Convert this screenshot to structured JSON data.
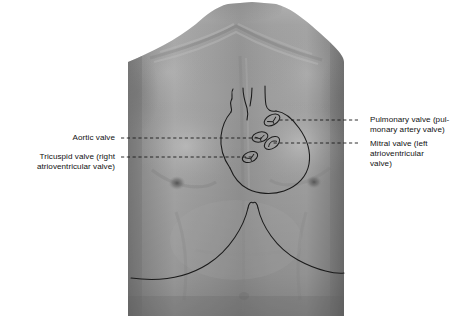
{
  "figure": {
    "type": "anatomical-surface-anatomy-diagram",
    "overlay": "hand-drawn cardiac outline with four heart valve positions",
    "background_color": "#ffffff",
    "line_color": "#1a1a1a",
    "photo_bounds": {
      "x": 128,
      "y": 2,
      "width": 216,
      "height": 314
    }
  },
  "labels": [
    {
      "id": "aortic-valve",
      "side": "left",
      "text": "Aortic valve",
      "x": 115,
      "y": 133,
      "leader": {
        "from_x": 121,
        "to_x": 262,
        "y": 138
      }
    },
    {
      "id": "tricuspid-valve",
      "side": "left",
      "text": "Tricuspid valve (right\natrioventricular valve)",
      "x": 115,
      "y": 152,
      "leader": {
        "from_x": 121,
        "to_x": 252,
        "y": 157
      }
    },
    {
      "id": "pulmonary-valve",
      "side": "right",
      "text": "Pulmonary valve (pul-\nmonary artery valve)",
      "x": 370,
      "y": 115,
      "leader": {
        "from_x": 358,
        "to_x": 279,
        "y": 120
      }
    },
    {
      "id": "mitral-valve",
      "side": "right",
      "text": "Mitral valve (left\natrioventricular\nvalve)",
      "x": 370,
      "y": 139,
      "leader": {
        "from_x": 358,
        "to_x": 272,
        "y": 143
      }
    }
  ],
  "valves": [
    {
      "id": "pulmonary",
      "cx": 272,
      "cy": 120,
      "rx": 8.5,
      "ry": 5.0,
      "rotation": -28
    },
    {
      "id": "aortic",
      "cx": 260,
      "cy": 137,
      "rx": 8.0,
      "ry": 5.0,
      "rotation": -14
    },
    {
      "id": "mitral",
      "cx": 272,
      "cy": 143,
      "rx": 8.5,
      "ry": 5.2,
      "rotation": -34
    },
    {
      "id": "tricuspid",
      "cx": 250,
      "cy": 157,
      "rx": 8.0,
      "ry": 5.0,
      "rotation": -22
    }
  ],
  "landmarks": [
    {
      "id": "left-nipple",
      "cx": 177,
      "cy": 183
    },
    {
      "id": "right-nipple",
      "cx": 314,
      "cy": 182
    },
    {
      "id": "xiphoid-notch",
      "cx": 253,
      "cy": 204
    }
  ],
  "colors": {
    "background": "#ffffff",
    "skin_mid": "#8e8e8e",
    "skin_light": "#b3b3b3",
    "skin_dark": "#6a6a6a",
    "outline": "#1a1a1a",
    "text": "#111111"
  }
}
